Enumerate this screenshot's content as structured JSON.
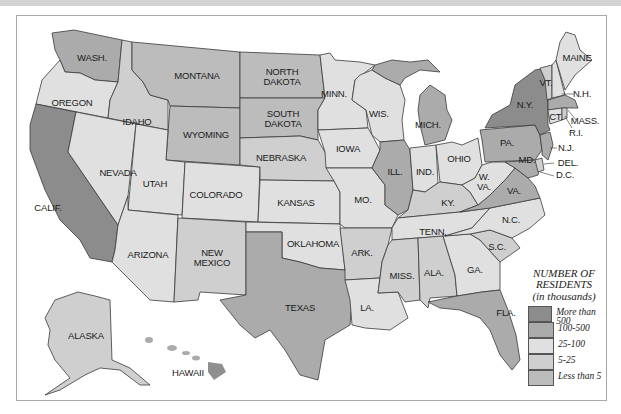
{
  "legend": {
    "title": "NUMBER OF RESIDENTS",
    "subtitle": "(in thousands)",
    "items": [
      {
        "label": "More than 500",
        "color": "#8c8c8c"
      },
      {
        "label": "100-500",
        "color": "#ababab"
      },
      {
        "label": "25-100",
        "color": "#e0e0e0"
      },
      {
        "label": "5-25",
        "color": "#cfcfcf"
      },
      {
        "label": "Less than 5",
        "color": "#bcbcbc"
      }
    ]
  },
  "states": [
    {
      "name": "WASH.",
      "category": "100-500"
    },
    {
      "name": "OREGON",
      "category": "25-100"
    },
    {
      "name": "CALIF.",
      "category": "More than 500"
    },
    {
      "name": "IDAHO",
      "category": "5-25"
    },
    {
      "name": "NEVADA",
      "category": "25-100"
    },
    {
      "name": "MONTANA",
      "category": "Less than 5"
    },
    {
      "name": "WYOMING",
      "category": "Less than 5"
    },
    {
      "name": "UTAH",
      "category": "25-100"
    },
    {
      "name": "ARIZONA",
      "category": "25-100"
    },
    {
      "name": "COLORADO",
      "category": "25-100"
    },
    {
      "name": "NEW MEXICO",
      "category": "5-25"
    },
    {
      "name": "NORTH DAKOTA",
      "category": "Less than 5"
    },
    {
      "name": "SOUTH DAKOTA",
      "category": "Less than 5"
    },
    {
      "name": "NEBRASKA",
      "category": "5-25"
    },
    {
      "name": "KANSAS",
      "category": "25-100"
    },
    {
      "name": "OKLAHOMA",
      "category": "25-100"
    },
    {
      "name": "TEXAS",
      "category": "100-500"
    },
    {
      "name": "MINN.",
      "category": "25-100"
    },
    {
      "name": "IOWA",
      "category": "25-100"
    },
    {
      "name": "MO.",
      "category": "25-100"
    },
    {
      "name": "ARK.",
      "category": "5-25"
    },
    {
      "name": "LA.",
      "category": "25-100"
    },
    {
      "name": "WIS.",
      "category": "25-100"
    },
    {
      "name": "ILL.",
      "category": "100-500"
    },
    {
      "name": "MICH.",
      "category": "100-500"
    },
    {
      "name": "IND.",
      "category": "25-100"
    },
    {
      "name": "OHIO",
      "category": "25-100"
    },
    {
      "name": "KY.",
      "category": "5-25"
    },
    {
      "name": "TENN.",
      "category": "25-100"
    },
    {
      "name": "MISS.",
      "category": "5-25"
    },
    {
      "name": "ALA.",
      "category": "5-25"
    },
    {
      "name": "GA.",
      "category": "25-100"
    },
    {
      "name": "FLA.",
      "category": "100-500"
    },
    {
      "name": "S.C.",
      "category": "5-25"
    },
    {
      "name": "N.C.",
      "category": "25-100"
    },
    {
      "name": "VA.",
      "category": "100-500"
    },
    {
      "name": "W. VA.",
      "category": "25-100"
    },
    {
      "name": "PA.",
      "category": "100-500"
    },
    {
      "name": "N.Y.",
      "category": "More than 500"
    },
    {
      "name": "VT.",
      "category": "5-25"
    },
    {
      "name": "N.H.",
      "category": "25-100"
    },
    {
      "name": "MAINE",
      "category": "25-100"
    },
    {
      "name": "MASS.",
      "category": "100-500"
    },
    {
      "name": "R.I.",
      "category": "5-25"
    },
    {
      "name": "CT.",
      "category": "25-100"
    },
    {
      "name": "N.J.",
      "category": "100-500"
    },
    {
      "name": "DEL.",
      "category": "5-25"
    },
    {
      "name": "MD.",
      "category": "100-500"
    },
    {
      "name": "D.C.",
      "category": "5-25"
    },
    {
      "name": "ALASKA",
      "category": "5-25"
    },
    {
      "name": "HAWAII",
      "category": "100-500"
    }
  ]
}
